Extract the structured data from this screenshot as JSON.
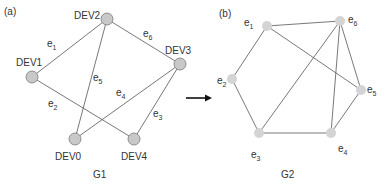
{
  "panel_a": {
    "tag": "(a)",
    "caption": "G1",
    "nodes": [
      {
        "id": "DEV2",
        "label": "DEV2",
        "x": 107,
        "y": 19
      },
      {
        "id": "DEV3",
        "label": "DEV3",
        "x": 180,
        "y": 64
      },
      {
        "id": "DEV1",
        "label": "DEV1",
        "x": 32,
        "y": 77
      },
      {
        "id": "DEV0",
        "label": "DEV0",
        "x": 75,
        "y": 139
      },
      {
        "id": "DEV4",
        "label": "DEV4",
        "x": 134,
        "y": 139
      }
    ],
    "edges": [
      {
        "label": "e1",
        "from": "DEV1",
        "to": "DEV2"
      },
      {
        "label": "e2",
        "from": "DEV1",
        "to": "DEV4"
      },
      {
        "label": "e3",
        "from": "DEV3",
        "to": "DEV4"
      },
      {
        "label": "e4",
        "from": "DEV3",
        "to": "DEV0"
      },
      {
        "label": "e5",
        "from": "DEV2",
        "to": "DEV0"
      },
      {
        "label": "e6",
        "from": "DEV2",
        "to": "DEV3"
      }
    ]
  },
  "arrow": {
    "direction": "right"
  },
  "panel_b": {
    "tag": "(b)",
    "caption": "G2",
    "nodes": [
      {
        "id": "e1",
        "x": 267,
        "y": 26
      },
      {
        "id": "e6",
        "x": 340,
        "y": 21
      },
      {
        "id": "e2",
        "x": 232,
        "y": 79
      },
      {
        "id": "e5",
        "x": 361,
        "y": 90
      },
      {
        "id": "e3",
        "x": 259,
        "y": 133
      },
      {
        "id": "e4",
        "x": 331,
        "y": 133
      }
    ],
    "edges": [
      [
        "e1",
        "e6"
      ],
      [
        "e1",
        "e2"
      ],
      [
        "e1",
        "e5"
      ],
      [
        "e6",
        "e3"
      ],
      [
        "e6",
        "e4"
      ],
      [
        "e6",
        "e5"
      ],
      [
        "e2",
        "e3"
      ],
      [
        "e3",
        "e4"
      ],
      [
        "e4",
        "e5"
      ]
    ]
  },
  "colors": {
    "node_fill_a": "#c8c8c8",
    "node_stroke_a": "#7a7a7a",
    "node_fill_b": "#d4d4d4",
    "edge": "#555555",
    "text": "#333333"
  }
}
